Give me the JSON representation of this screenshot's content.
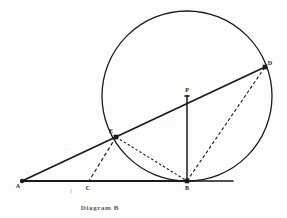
{
  "figure": {
    "caption": "Diagram B",
    "type": "euclidean-geometry-construction",
    "background_color": "#fdfdfc",
    "ink_color": "#1a1a1a",
    "faint_ink_color": "#8c8c8c"
  },
  "points": [
    {
      "id": "A",
      "label": "A",
      "x": 22,
      "y": 181,
      "marker": "dot",
      "label_dx": -4,
      "label_dy": 7
    },
    {
      "id": "C",
      "label": "C",
      "x": 88,
      "y": 181,
      "marker": "tick",
      "label_dx": 0,
      "label_dy": 9
    },
    {
      "id": "B",
      "label": "B",
      "x": 187,
      "y": 181,
      "marker": "square",
      "label_dx": 0,
      "label_dy": 9
    },
    {
      "id": "E",
      "label": "E",
      "x": 116,
      "y": 137,
      "marker": "square",
      "label_dx": -5,
      "label_dy": -4
    },
    {
      "id": "P",
      "label": "P",
      "x": 187,
      "y": 96,
      "marker": "tick",
      "label_dx": 0,
      "label_dy": -4
    },
    {
      "id": "D",
      "label": "D",
      "x": 265,
      "y": 67,
      "marker": "square",
      "label_dx": 5,
      "label_dy": -2
    }
  ],
  "circle": {
    "label": "circle-P",
    "center_x": 187,
    "center_y": 96,
    "radius": 85,
    "stroke_width": 1.3
  },
  "solid_lines": [
    {
      "label": "base-line-A-B",
      "x1": 22,
      "y1": 181,
      "x2": 187,
      "y2": 181,
      "width": 2.1
    },
    {
      "label": "base-line-B-extension",
      "x1": 187,
      "y1": 181,
      "x2": 233,
      "y2": 181,
      "width": 1.5
    },
    {
      "label": "secant-line-A-D",
      "x1": 22,
      "y1": 181,
      "x2": 265,
      "y2": 67,
      "width": 1.7
    },
    {
      "label": "radius-line-P-B",
      "x1": 187,
      "y1": 96,
      "x2": 187,
      "y2": 181,
      "width": 1.5
    }
  ],
  "dashed_lines": [
    {
      "label": "chord-B-D",
      "x1": 187,
      "y1": 181,
      "x2": 265,
      "y2": 67,
      "dash": "3.2 2.4",
      "width": 1.1
    },
    {
      "label": "chord-E-B",
      "x1": 116,
      "y1": 137,
      "x2": 187,
      "y2": 181,
      "dash": "2.4 2.2",
      "width": 1.1
    },
    {
      "label": "perpendicular-E-C",
      "x1": 116,
      "y1": 137,
      "x2": 89,
      "y2": 181,
      "dash": "3.6 2.6",
      "width": 1.2
    }
  ],
  "faint_marks": [
    {
      "label": "tick-on-secant",
      "x": 66,
      "y": 152,
      "text": "·"
    },
    {
      "label": "tick-above-E",
      "x": 110,
      "y": 124,
      "text": "·"
    },
    {
      "label": "interior-dot",
      "x": 168,
      "y": 125,
      "text": "·"
    },
    {
      "label": "sub-base-mark",
      "x": 71,
      "y": 193,
      "text": "l"
    }
  ],
  "caption_position": {
    "x": 100,
    "y": 210
  }
}
